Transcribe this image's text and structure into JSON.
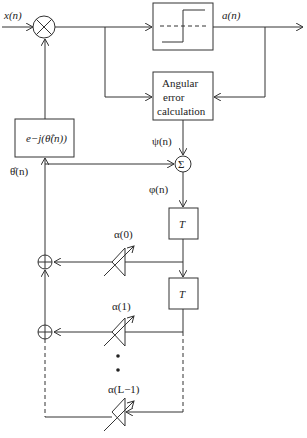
{
  "diagram": {
    "input_label": "x(n)",
    "output_label": "a(n)",
    "angular_error_block": {
      "line1": "Angular",
      "line2": "error",
      "line3": "calculation"
    },
    "exp_block_label": "e−j(θ̂(n))",
    "theta_hat_label": "θ̂(n)",
    "psi_label": "ψ(n)",
    "phi_label": "φ(n)",
    "sum_symbol": "Σ",
    "delay_blocks": [
      "T",
      "T"
    ],
    "taps": [
      {
        "label": "α(0)"
      },
      {
        "label": "α(1)"
      },
      {
        "label": "α(L−1)"
      }
    ],
    "ellipsis": "• •"
  }
}
